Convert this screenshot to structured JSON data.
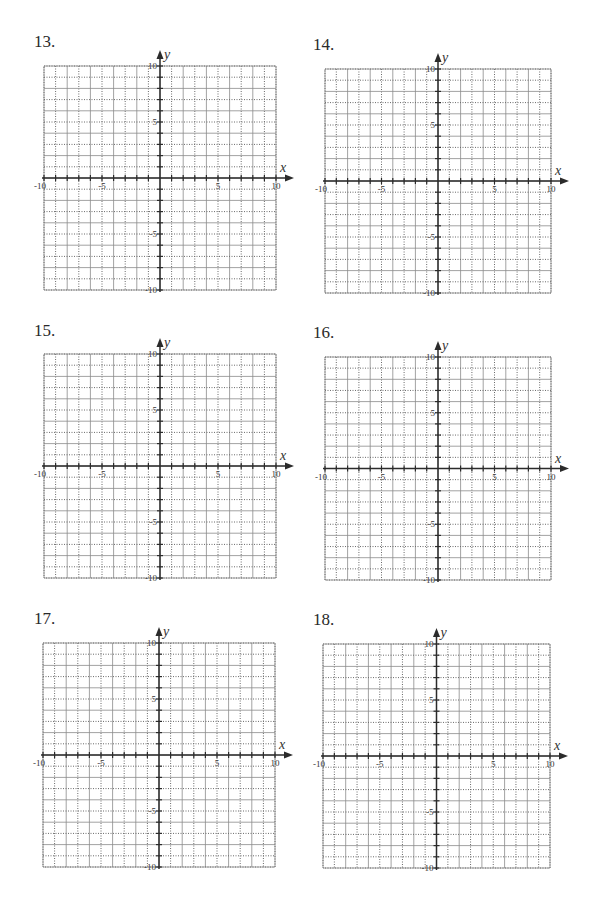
{
  "page": {
    "background": "#ffffff",
    "grid_color": "#8a8a8a",
    "dotted_color": "#6a6a6a",
    "axis_color": "#2b2b2b"
  },
  "axis_labels": {
    "x": "x",
    "y": "y"
  },
  "tick_labels": {
    "x_neg10": "-10",
    "x_neg5": "-5",
    "x_pos5": "5",
    "x_pos10": "10",
    "y_pos10": "10",
    "y_pos5": "5",
    "y_neg5": "-5",
    "y_neg10": "-10"
  },
  "problems": [
    {
      "number": "13.",
      "label_x": 34,
      "label_y": 33,
      "left": 44,
      "top": 66,
      "right": 276,
      "bottom": 290
    },
    {
      "number": "14.",
      "label_x": 313,
      "label_y": 36,
      "left": 325,
      "top": 69,
      "right": 551,
      "bottom": 293
    },
    {
      "number": "15.",
      "label_x": 34,
      "label_y": 322,
      "left": 44,
      "top": 354,
      "right": 276,
      "bottom": 578
    },
    {
      "number": "16.",
      "label_x": 313,
      "label_y": 324,
      "left": 325,
      "top": 357,
      "right": 551,
      "bottom": 580
    },
    {
      "number": "17.",
      "label_x": 34,
      "label_y": 610,
      "left": 43,
      "top": 643,
      "right": 275,
      "bottom": 867
    },
    {
      "number": "18.",
      "label_x": 313,
      "label_y": 611,
      "left": 323,
      "top": 644,
      "right": 550,
      "bottom": 868
    }
  ],
  "chart_data": [
    {
      "type": "table",
      "title": "13.",
      "xlabel": "x",
      "ylabel": "y",
      "xlim": [
        -10,
        10
      ],
      "ylim": [
        -10,
        10
      ],
      "grid": true,
      "grid_step": 1,
      "x_ticks": [
        -10,
        -5,
        5,
        10
      ],
      "y_ticks": [
        10,
        5,
        -5,
        -10
      ],
      "series": []
    },
    {
      "type": "table",
      "title": "14.",
      "xlabel": "x",
      "ylabel": "y",
      "xlim": [
        -10,
        10
      ],
      "ylim": [
        -10,
        10
      ],
      "grid": true,
      "grid_step": 1,
      "x_ticks": [
        -10,
        -5,
        5,
        10
      ],
      "y_ticks": [
        10,
        5,
        -5,
        -10
      ],
      "series": []
    },
    {
      "type": "table",
      "title": "15.",
      "xlabel": "x",
      "ylabel": "y",
      "xlim": [
        -10,
        10
      ],
      "ylim": [
        -10,
        10
      ],
      "grid": true,
      "grid_step": 1,
      "x_ticks": [
        -10,
        -5,
        5,
        10
      ],
      "y_ticks": [
        10,
        5,
        -5,
        -10
      ],
      "series": []
    },
    {
      "type": "table",
      "title": "16.",
      "xlabel": "x",
      "ylabel": "y",
      "xlim": [
        -10,
        10
      ],
      "ylim": [
        -10,
        10
      ],
      "grid": true,
      "grid_step": 1,
      "x_ticks": [
        -10,
        -5,
        5,
        10
      ],
      "y_ticks": [
        10,
        5,
        -5,
        -10
      ],
      "series": []
    },
    {
      "type": "table",
      "title": "17.",
      "xlabel": "x",
      "ylabel": "y",
      "xlim": [
        -10,
        10
      ],
      "ylim": [
        -10,
        10
      ],
      "grid": true,
      "grid_step": 1,
      "x_ticks": [
        -10,
        -5,
        5,
        10
      ],
      "y_ticks": [
        10,
        5,
        -5,
        -10
      ],
      "series": []
    },
    {
      "type": "table",
      "title": "18.",
      "xlabel": "x",
      "ylabel": "y",
      "xlim": [
        -10,
        10
      ],
      "ylim": [
        -10,
        10
      ],
      "grid": true,
      "grid_step": 1,
      "x_ticks": [
        -10,
        -5,
        5,
        10
      ],
      "y_ticks": [
        10,
        5,
        -5,
        -10
      ],
      "series": []
    }
  ]
}
